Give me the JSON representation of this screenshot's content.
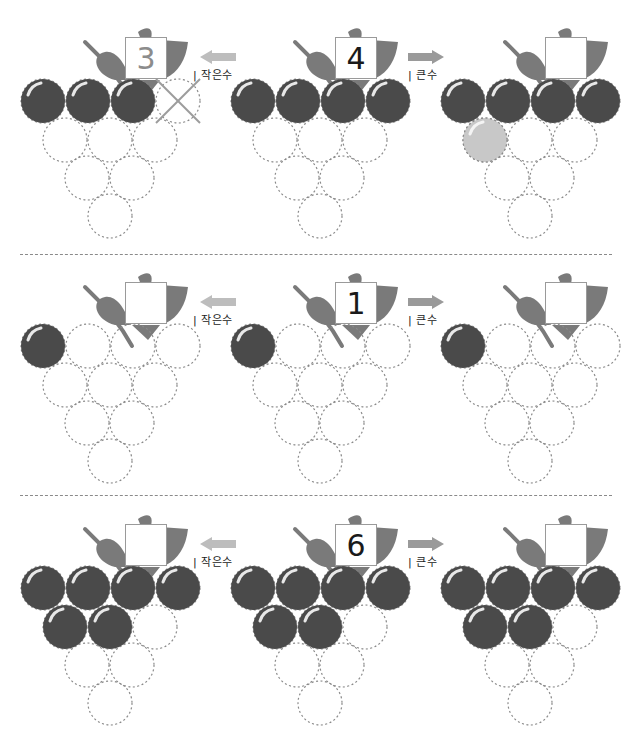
{
  "worksheet": {
    "labels": {
      "smaller": "| 작은수",
      "larger": "| 큰수"
    },
    "colors": {
      "grape": "#4a4a4a",
      "example_grape": "#c8c8c8",
      "leaf": "#7a7a7a",
      "arrow_left": "#bdbdbd",
      "arrow_right": "#9a9a9a",
      "dashed": "#8a8a8a"
    },
    "problems": [
      {
        "smaller": {
          "value": "3",
          "filled": 3,
          "crossed": true
        },
        "given": {
          "value": "4",
          "filled": 4
        },
        "larger": {
          "value": "",
          "filled": 4,
          "example_added": true
        }
      },
      {
        "smaller": {
          "value": "",
          "filled": 1
        },
        "given": {
          "value": "1",
          "filled": 1
        },
        "larger": {
          "value": "",
          "filled": 1
        }
      },
      {
        "smaller": {
          "value": "",
          "filled": 6
        },
        "given": {
          "value": "6",
          "filled": 6
        },
        "larger": {
          "value": "",
          "filled": 6
        }
      }
    ]
  }
}
